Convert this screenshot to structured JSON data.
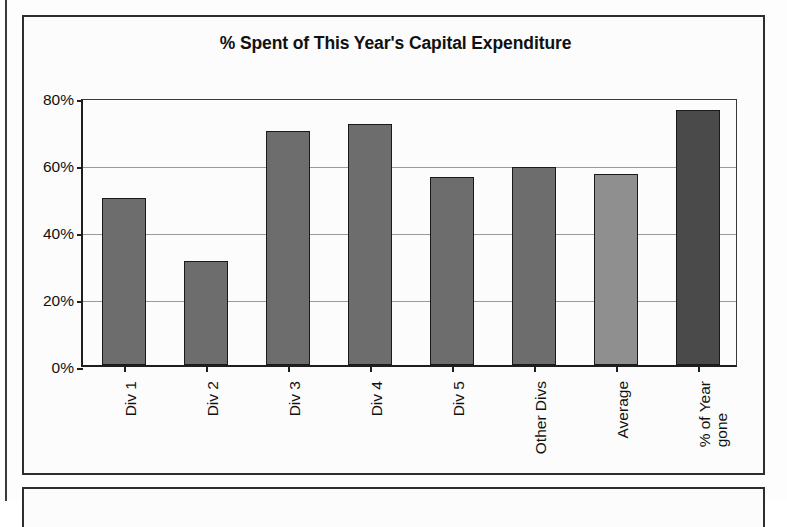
{
  "chart_data": {
    "type": "bar",
    "title": "% Spent of This Year's Capital Expenditure",
    "xlabel": "",
    "ylabel": "",
    "categories": [
      "Div 1",
      "Div 2",
      "Div 3",
      "Div 4",
      "Div 5",
      "Other Divs",
      "Average",
      "% of Year\ngone"
    ],
    "values": [
      50,
      31,
      70,
      72,
      56,
      59,
      57,
      76
    ],
    "bar_colors": [
      "#6d6d6d",
      "#6d6d6d",
      "#6d6d6d",
      "#6d6d6d",
      "#6d6d6d",
      "#6d6d6d",
      "#8f8f8f",
      "#4a4a4a"
    ],
    "ylim": [
      0,
      80
    ],
    "ytick_values": [
      0,
      20,
      40,
      60,
      80
    ],
    "ytick_labels": [
      "0%",
      "20%",
      "40%",
      "60%",
      "80%"
    ],
    "grid": true,
    "gridlines_at": [
      20,
      40,
      60
    ],
    "legend": null,
    "legend_position": "none",
    "value_format": "percent"
  },
  "frame": {
    "chart_border_color": "#2e2e2e",
    "axis_color": "#1e1e1e",
    "grid_color": "#9a9a9a",
    "background": "#fcfcfc"
  }
}
